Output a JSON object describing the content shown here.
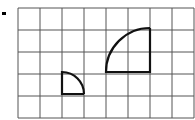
{
  "diagram": {
    "grid": {
      "columns": 8,
      "rows": 5,
      "cell_size": 22,
      "origin": [
        18,
        8
      ],
      "line_color": "#555555"
    },
    "marker": {
      "x": 2,
      "y": 12,
      "w": 4,
      "h": 3,
      "color": "#000000"
    },
    "shapes": [
      {
        "name": "small-quarter-circle",
        "corner": [
          62,
          94
        ],
        "radius": 22,
        "orientation": "up-right",
        "stroke": "#111111"
      },
      {
        "name": "large-quarter-circle",
        "corner": [
          150,
          72
        ],
        "radius": 44,
        "orientation": "up-left",
        "stroke": "#111111"
      }
    ]
  }
}
